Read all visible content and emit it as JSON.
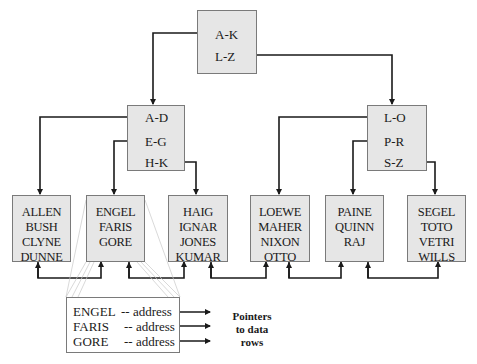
{
  "diagram": {
    "type": "B-tree index",
    "root": {
      "keys": [
        "A-K",
        "L-Z"
      ]
    },
    "internal_nodes": [
      {
        "id": "left",
        "keys": [
          "A-D",
          "E-G",
          "H-K"
        ]
      },
      {
        "id": "right",
        "keys": [
          "L-O",
          "P-R",
          "S-Z"
        ]
      }
    ],
    "leaves": [
      {
        "names": [
          "ALLEN",
          "BUSH",
          "CLYNE",
          "DUNNE"
        ]
      },
      {
        "names": [
          "ENGEL",
          "FARIS",
          "GORE"
        ]
      },
      {
        "names": [
          "HAIG",
          "IGNAR",
          "JONES",
          "KUMAR"
        ]
      },
      {
        "names": [
          "LOEWE",
          "MAHER",
          "NIXON",
          "OTTO"
        ]
      },
      {
        "names": [
          "PAINE",
          "QUINN",
          "RAJ"
        ]
      },
      {
        "names": [
          "SEGEL",
          "TOTO",
          "VETRI",
          "WILLS"
        ]
      }
    ],
    "leaf_detail": {
      "rows": [
        {
          "key": "ENGEL",
          "value": "-- address"
        },
        {
          "key": "FARIS",
          "value": "-- address"
        },
        {
          "key": "GORE",
          "value": "-- address"
        }
      ]
    },
    "pointer_label": [
      "Pointers",
      "to data",
      "rows"
    ],
    "colors": {
      "node_fill": "#e6e6e6",
      "node_border": "#7a7a7a",
      "line": "#1a1a1a"
    }
  }
}
